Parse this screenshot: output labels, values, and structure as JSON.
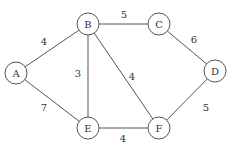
{
  "graph": {
    "nodes": [
      {
        "id": "A",
        "label": "A",
        "x": 16,
        "y": 73
      },
      {
        "id": "B",
        "label": "B",
        "x": 88,
        "y": 24
      },
      {
        "id": "C",
        "label": "C",
        "x": 159,
        "y": 24
      },
      {
        "id": "D",
        "label": "D",
        "x": 215,
        "y": 71
      },
      {
        "id": "E",
        "label": "E",
        "x": 88,
        "y": 128
      },
      {
        "id": "F",
        "label": "F",
        "x": 159,
        "y": 128
      }
    ],
    "edges": [
      {
        "from": "A",
        "to": "B",
        "weight": "4",
        "lx": 44,
        "ly": 45
      },
      {
        "from": "B",
        "to": "C",
        "weight": "5",
        "lx": 124,
        "ly": 18
      },
      {
        "from": "C",
        "to": "D",
        "weight": "6",
        "lx": 194,
        "ly": 43
      },
      {
        "from": "B",
        "to": "E",
        "weight": "3",
        "lx": 78,
        "ly": 77
      },
      {
        "from": "B",
        "to": "F",
        "weight": "4",
        "lx": 132,
        "ly": 80
      },
      {
        "from": "A",
        "to": "E",
        "weight": "7",
        "lx": 44,
        "ly": 111
      },
      {
        "from": "E",
        "to": "F",
        "weight": "4",
        "lx": 123,
        "ly": 142
      },
      {
        "from": "D",
        "to": "F",
        "weight": "5",
        "lx": 206,
        "ly": 111
      }
    ],
    "colors": {
      "stroke": "#555555",
      "text": "#333333",
      "background": "#ffffff"
    }
  }
}
